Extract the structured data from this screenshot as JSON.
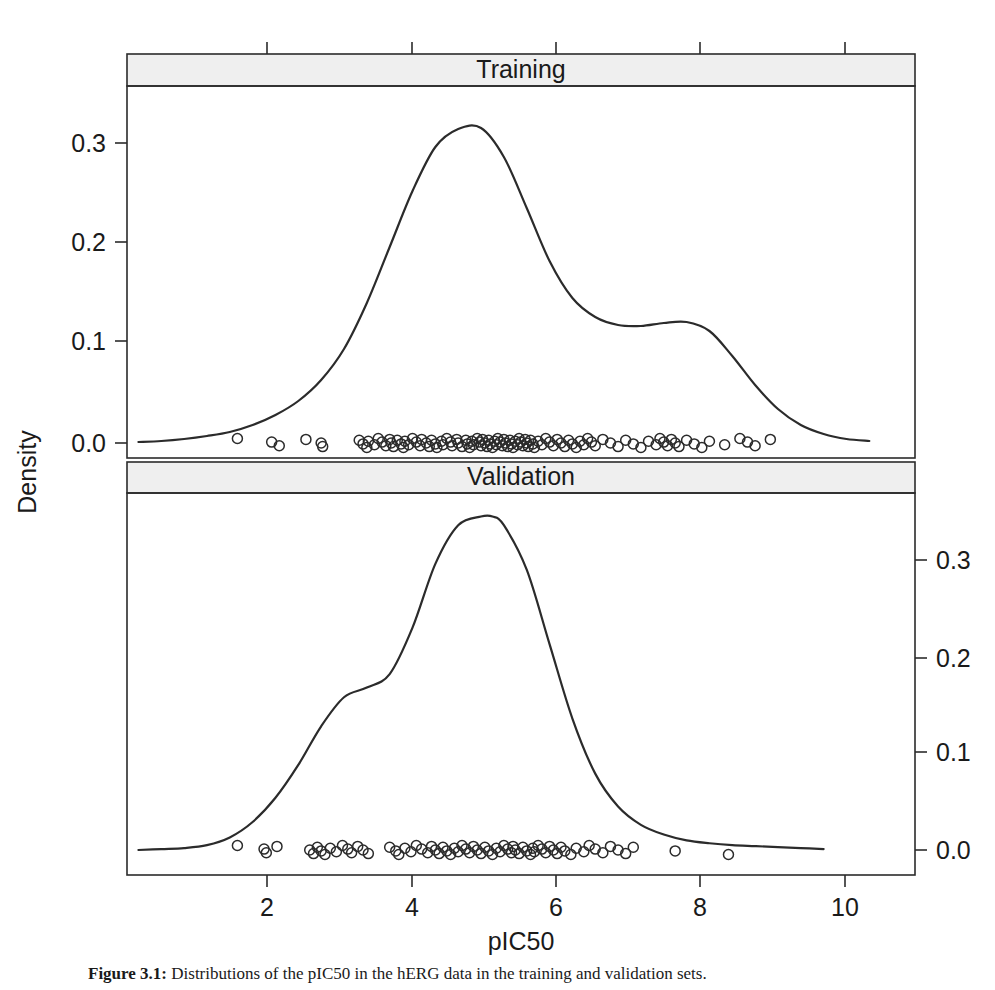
{
  "figure": {
    "caption_label": "Figure 3.1:",
    "caption_text": "Distributions of the pIC50 in the hERG data in the training and validation sets."
  },
  "axes": {
    "x_axis_title": "pIC50",
    "y_axis_title": "Density",
    "x_tick_labels": [
      "2",
      "4",
      "6",
      "8",
      "10"
    ],
    "y_tick_labels_training": [
      "0.0",
      "0.1",
      "0.2",
      "0.3"
    ],
    "y_tick_labels_validation": [
      "0.0",
      "0.1",
      "0.2",
      "0.3"
    ]
  },
  "panels": [
    {
      "strip_label": "Training",
      "y_axis_side": "left"
    },
    {
      "strip_label": "Validation",
      "y_axis_side": "right"
    }
  ],
  "colors": {
    "line": "#2b2b2b",
    "strip_background": "#efefef",
    "page_background": "#ffffff"
  },
  "chart_data": {
    "type": "line",
    "title": "",
    "xlabel": "pIC50",
    "ylabel": "Density",
    "xlim": [
      0.55,
      10.9
    ],
    "grid": false,
    "legend": "none",
    "layout": "two stacked conditioned panels (lattice densityplot), strip labels on top of each panel",
    "panels": [
      {
        "name": "Training",
        "ylim": [
          -0.012,
          0.355
        ],
        "y_ticks": [
          0.0,
          0.1,
          0.2,
          0.3
        ],
        "peak": {
          "x": 5.2,
          "y": 0.315
        },
        "secondary_peak": {
          "x": 7.7,
          "y": 0.121
        },
        "series": [
          {
            "name": "density",
            "x": [
              0.7,
              1.0,
              1.3,
              1.6,
              1.9,
              2.2,
              2.5,
              2.8,
              3.1,
              3.4,
              3.7,
              4.0,
              4.3,
              4.6,
              4.9,
              5.2,
              5.5,
              5.8,
              6.1,
              6.4,
              6.7,
              7.0,
              7.3,
              7.6,
              7.9,
              8.2,
              8.5,
              8.8,
              9.1,
              9.4,
              9.7,
              10.0,
              10.3
            ],
            "y": [
              0.001,
              0.002,
              0.004,
              0.007,
              0.011,
              0.018,
              0.028,
              0.042,
              0.063,
              0.094,
              0.14,
              0.196,
              0.252,
              0.296,
              0.314,
              0.315,
              0.286,
              0.235,
              0.182,
              0.145,
              0.126,
              0.118,
              0.117,
              0.12,
              0.121,
              0.112,
              0.087,
              0.058,
              0.034,
              0.018,
              0.009,
              0.004,
              0.002
            ]
          }
        ],
        "rug": {
          "marker": "open circle",
          "y": 0.0,
          "x": [
            2.0,
            2.45,
            2.55,
            2.9,
            3.1,
            3.12,
            3.6,
            3.65,
            3.7,
            3.72,
            3.8,
            3.85,
            3.9,
            3.95,
            4.0,
            4.02,
            4.05,
            4.1,
            4.15,
            4.18,
            4.2,
            4.25,
            4.3,
            4.35,
            4.4,
            4.42,
            4.48,
            4.52,
            4.55,
            4.6,
            4.62,
            4.68,
            4.7,
            4.75,
            4.8,
            4.82,
            4.88,
            4.9,
            4.95,
            5.0,
            5.02,
            5.05,
            5.08,
            5.1,
            5.15,
            5.18,
            5.2,
            5.22,
            5.25,
            5.28,
            5.3,
            5.32,
            5.35,
            5.38,
            5.4,
            5.42,
            5.45,
            5.48,
            5.5,
            5.52,
            5.55,
            5.58,
            5.6,
            5.62,
            5.65,
            5.68,
            5.7,
            5.72,
            5.75,
            5.78,
            5.8,
            5.82,
            5.85,
            5.88,
            5.9,
            5.95,
            6.0,
            6.05,
            6.1,
            6.15,
            6.2,
            6.25,
            6.3,
            6.35,
            6.4,
            6.45,
            6.5,
            6.55,
            6.6,
            6.65,
            6.7,
            6.8,
            6.9,
            7.0,
            7.1,
            7.2,
            7.3,
            7.4,
            7.5,
            7.55,
            7.6,
            7.65,
            7.7,
            7.75,
            7.8,
            7.9,
            8.0,
            8.1,
            8.2,
            8.4,
            8.6,
            8.7,
            8.8,
            9.0
          ]
        }
      },
      {
        "name": "Validation",
        "ylim": [
          -0.012,
          0.375
        ],
        "y_ticks": [
          0.0,
          0.1,
          0.2,
          0.3
        ],
        "peak": {
          "x": 5.35,
          "y": 0.345
        },
        "shoulder": {
          "x": 3.7,
          "y": 0.168
        },
        "series": [
          {
            "name": "density",
            "x": [
              0.7,
              1.0,
              1.3,
              1.6,
              1.9,
              2.2,
              2.5,
              2.8,
              3.1,
              3.4,
              3.7,
              4.0,
              4.3,
              4.6,
              4.9,
              5.2,
              5.35,
              5.5,
              5.8,
              6.1,
              6.4,
              6.7,
              7.0,
              7.3,
              7.6,
              7.9,
              8.2,
              8.5,
              8.8,
              9.1,
              9.4,
              9.7
            ],
            "y": [
              0.0,
              0.001,
              0.002,
              0.005,
              0.013,
              0.029,
              0.054,
              0.088,
              0.128,
              0.158,
              0.168,
              0.182,
              0.23,
              0.296,
              0.336,
              0.345,
              0.345,
              0.336,
              0.29,
              0.213,
              0.136,
              0.079,
              0.045,
              0.026,
              0.016,
              0.01,
              0.007,
              0.005,
              0.004,
              0.003,
              0.002,
              0.001
            ]
          }
        ],
        "rug": {
          "marker": "open circle",
          "y": 0.0,
          "x": [
            2.0,
            2.35,
            2.38,
            2.52,
            2.95,
            3.0,
            3.05,
            3.1,
            3.15,
            3.22,
            3.3,
            3.38,
            3.45,
            3.5,
            3.58,
            3.65,
            3.72,
            4.0,
            4.08,
            4.12,
            4.2,
            4.28,
            4.35,
            4.42,
            4.5,
            4.55,
            4.6,
            4.65,
            4.7,
            4.75,
            4.8,
            4.85,
            4.9,
            4.95,
            5.0,
            5.05,
            5.1,
            5.15,
            5.2,
            5.25,
            5.3,
            5.35,
            5.4,
            5.45,
            5.5,
            5.55,
            5.6,
            5.62,
            5.65,
            5.7,
            5.75,
            5.8,
            5.85,
            5.88,
            5.9,
            5.95,
            6.0,
            6.05,
            6.1,
            6.15,
            6.2,
            6.25,
            6.3,
            6.38,
            6.45,
            6.55,
            6.62,
            6.7,
            6.8,
            6.9,
            7.0,
            7.1,
            7.2,
            7.75,
            8.45
          ]
        }
      }
    ]
  }
}
